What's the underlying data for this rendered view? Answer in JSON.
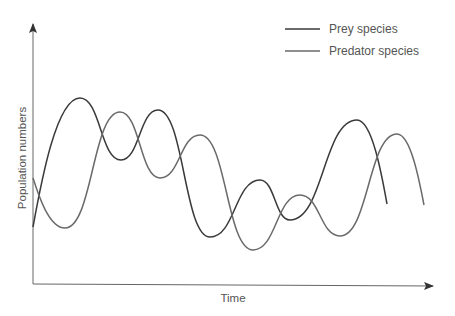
{
  "chart_data": {
    "type": "line",
    "title": "",
    "xlabel": "Time",
    "ylabel": "Population numbers",
    "grid": false,
    "legend_position": "top-right",
    "axes": {
      "x_ticks": false,
      "y_ticks": false,
      "arrows": true
    },
    "series": [
      {
        "name": "Prey species",
        "color": "#3a3a3a",
        "points": [
          [
            33,
            227
          ],
          [
            80,
            98
          ],
          [
            121,
            160
          ],
          [
            158,
            110
          ],
          [
            210,
            237
          ],
          [
            260,
            180
          ],
          [
            290,
            220
          ],
          [
            357,
            120
          ],
          [
            387,
            204
          ]
        ]
      },
      {
        "name": "Predator species",
        "color": "#6a6a6a",
        "points": [
          [
            33,
            178
          ],
          [
            65,
            228
          ],
          [
            120,
            112
          ],
          [
            160,
            178
          ],
          [
            200,
            135
          ],
          [
            253,
            250
          ],
          [
            300,
            195
          ],
          [
            340,
            236
          ],
          [
            397,
            134
          ],
          [
            424,
            205
          ]
        ]
      }
    ]
  },
  "legend": {
    "items": [
      {
        "label": "Prey species",
        "color": "#3a3a3a"
      },
      {
        "label": "Predator species",
        "color": "#6a6a6a"
      }
    ]
  },
  "axes": {
    "x_label": "Time",
    "y_label": "Population numbers",
    "color": "#666666"
  }
}
